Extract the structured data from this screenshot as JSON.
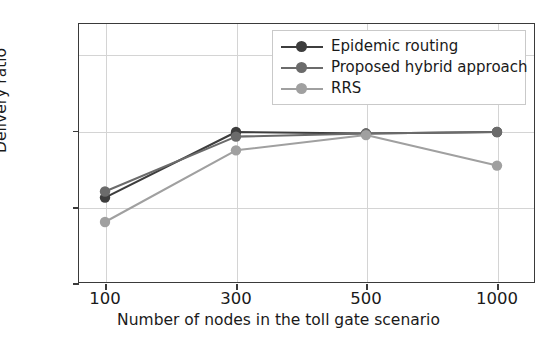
{
  "chart_data": {
    "type": "line",
    "title": "",
    "xlabel": "Number of nodes in the toll gate scenario",
    "ylabel": "Delivery ratio",
    "categories": [
      "100",
      "300",
      "500",
      "1000"
    ],
    "x_tick_labels": [
      "100",
      "300",
      "500",
      "1000"
    ],
    "y_tick_labels": [
      "0.9",
      "0.95",
      "1.0"
    ],
    "y_tick_values": [
      0.9,
      0.95,
      1.0
    ],
    "ylim": [
      0.9,
      1.0705
    ],
    "grid": true,
    "legend_position": "upper right",
    "series": [
      {
        "name": "Epidemic routing",
        "color": "#3d3d3d",
        "values": [
          0.956,
          0.999,
          0.998,
          0.999
        ]
      },
      {
        "name": "Proposed hybrid approach",
        "color": "#6b6b6b",
        "values": [
          0.96,
          0.996,
          0.998,
          0.999
        ]
      },
      {
        "name": "RRS",
        "color": "#a0a0a0",
        "values": [
          0.94,
          0.987,
          0.997,
          0.977
        ]
      }
    ]
  },
  "axes": {
    "xlabel": "Number of nodes in the toll gate scenario",
    "ylabel": "Delivery ratio"
  },
  "legend": {
    "entries": [
      {
        "label": "Epidemic routing"
      },
      {
        "label": "Proposed hybrid approach"
      },
      {
        "label": "RRS"
      }
    ]
  }
}
